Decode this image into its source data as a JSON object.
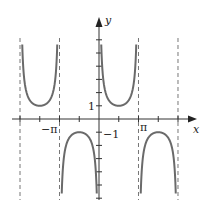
{
  "chart_data": {
    "type": "line",
    "title": "",
    "function": "y = csc x",
    "xlabel": "x",
    "ylabel": "y",
    "x_tick_labels": [
      {
        "label": "−π",
        "value": -3.14159
      },
      {
        "label": "π",
        "value": 3.14159
      }
    ],
    "y_tick_labels": [
      {
        "label": "1",
        "value": 1
      },
      {
        "label": "−1",
        "value": -1
      }
    ],
    "asymptotes_x": [
      -6.28318,
      -3.14159,
      3.14159,
      6.28318
    ],
    "xlim": [
      -7.0,
      7.6
    ],
    "ylim": [
      -6.1,
      7.7
    ],
    "grid": false,
    "series": [
      {
        "name": "csc x",
        "color": "#666666",
        "style": "solid"
      },
      {
        "name": "asymptotes",
        "color": "#666666",
        "style": "dashed"
      }
    ]
  },
  "labels": {
    "x_axis": "x",
    "y_axis": "y",
    "neg_pi": "−π",
    "pi": "π",
    "one": "1",
    "neg_one": "−1"
  },
  "colors": {
    "curve": "#6a6a6a",
    "axis": "#333333",
    "asymptote": "#777777"
  }
}
